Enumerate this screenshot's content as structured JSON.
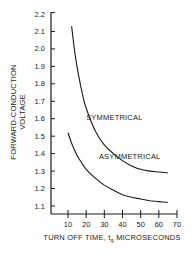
{
  "chart_data": {
    "type": "line",
    "title": "",
    "xlabel": "TURN OFF TIME, t_q MICROSECONDS",
    "xlabel_parts": {
      "pre": "TURN OFF TIME, t",
      "sub": "q",
      "post": " MICROSECONDS"
    },
    "ylabel": "FORWARD-CONDUCTION VOLTAGE",
    "ylabel_lines": [
      "FORWARD-CONDUCTION",
      "VOLTAGE"
    ],
    "xlim": [
      5,
      70
    ],
    "ylim": [
      1.05,
      2.2
    ],
    "xticks": [
      10,
      20,
      30,
      40,
      50,
      60,
      70
    ],
    "yticks": [
      1.1,
      1.2,
      1.3,
      1.4,
      1.5,
      1.6,
      1.7,
      1.8,
      1.9,
      2.0,
      2.1,
      2.2
    ],
    "ytick_labels": [
      "1.1",
      "1.2",
      "1.3",
      "1.4",
      "1.5",
      "1.6",
      "1.7",
      "1.8",
      "1.9",
      "2.0",
      "2.1",
      "2.2"
    ],
    "grid": false,
    "legend": "inline labels",
    "series": [
      {
        "name": "SYMMETRICAL",
        "x": [
          12,
          14,
          16,
          18,
          20,
          25,
          30,
          35,
          40,
          45,
          50,
          55,
          60,
          65
        ],
        "y": [
          2.13,
          1.96,
          1.84,
          1.74,
          1.66,
          1.53,
          1.45,
          1.4,
          1.36,
          1.33,
          1.31,
          1.3,
          1.295,
          1.29
        ],
        "label_position": {
          "x": 20,
          "y": 1.59
        }
      },
      {
        "name": "ASYMMETRICAL",
        "x": [
          10,
          12,
          15,
          18,
          20,
          25,
          30,
          35,
          40,
          45,
          50,
          55,
          60,
          65
        ],
        "y": [
          1.52,
          1.46,
          1.39,
          1.34,
          1.31,
          1.26,
          1.22,
          1.19,
          1.165,
          1.15,
          1.14,
          1.13,
          1.125,
          1.12
        ],
        "label_position": {
          "x": 27,
          "y": 1.37
        }
      }
    ]
  },
  "colors": {
    "line": "#1a1a1a",
    "background": "#ffffff"
  }
}
